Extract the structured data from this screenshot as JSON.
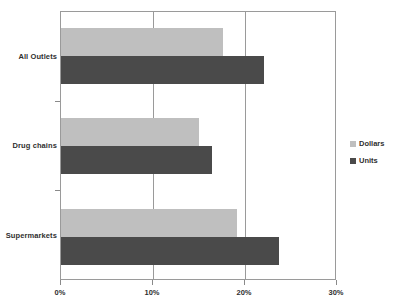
{
  "chart_data": {
    "type": "bar",
    "orientation": "horizontal",
    "title": "",
    "xlabel": "",
    "ylabel": "",
    "categories": [
      "Supermarkets",
      "Drug chains",
      "All Outlets"
    ],
    "series": [
      {
        "name": "Dollars",
        "color": "#bfbfbf",
        "values": [
          19.1,
          15.0,
          17.6
        ]
      },
      {
        "name": "Units",
        "color": "#4a4a4a",
        "values": [
          23.7,
          16.4,
          22.1
        ]
      }
    ],
    "xlim": [
      0,
      30
    ],
    "xticks": [
      0,
      10,
      20,
      30
    ],
    "xtick_labels": [
      "0%",
      "10%",
      "20%",
      "30%"
    ],
    "grid": "vertical",
    "legend_position": "right",
    "value_format": "percent"
  },
  "axis": {
    "x": {
      "ticks": [
        {
          "label": "0%",
          "value": 0
        },
        {
          "label": "10%",
          "value": 10
        },
        {
          "label": "20%",
          "value": 20
        },
        {
          "label": "30%",
          "value": 30
        }
      ]
    },
    "y": {
      "categories": [
        {
          "label": "All Outlets"
        },
        {
          "label": "Drug chains"
        },
        {
          "label": "Supermarkets"
        }
      ]
    }
  },
  "legend": {
    "items": [
      {
        "label": "Dollars",
        "color": "#bfbfbf"
      },
      {
        "label": "Units",
        "color": "#4a4a4a"
      }
    ]
  },
  "colors": {
    "dollars": "#bfbfbf",
    "units": "#4a4a4a",
    "axis": "#9a9a9a",
    "text": "#2f2f2f",
    "background": "#ffffff"
  }
}
